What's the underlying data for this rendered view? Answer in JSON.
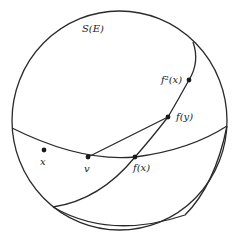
{
  "diagram": {
    "title_label": "S(E)",
    "points": {
      "x": "x",
      "v": "v",
      "fx": "f(x)",
      "fy": "f(y)",
      "f2x": "f²(x)"
    },
    "colors": {
      "stroke": "#2a2a2a",
      "background": "#ffffff"
    }
  }
}
